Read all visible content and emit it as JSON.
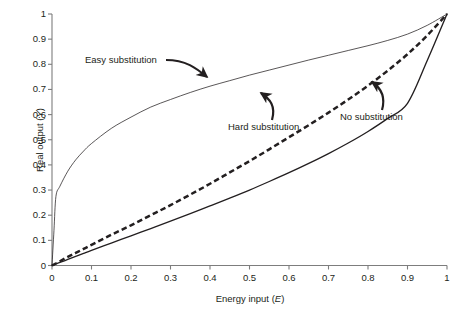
{
  "figure": {
    "background": "#ffffff",
    "ink_color": "#231f20"
  },
  "axes": {
    "x": {
      "title_text": "Energy input (",
      "title_var": "E",
      "title_close": ")",
      "ticks": [
        "0",
        "0.1",
        "0.2",
        "0.3",
        "0.4",
        "0.5",
        "0.6",
        "0.7",
        "0.8",
        "0.9",
        "1"
      ],
      "min": 0,
      "max": 1
    },
    "y": {
      "title_text": "Real output (",
      "title_var": "Y",
      "title_close": ")",
      "ticks": [
        "0",
        "0.1",
        "0.2",
        "0.3",
        "0.4",
        "0.5",
        "0.6",
        "0.7",
        "0.8",
        "0.9",
        "1"
      ],
      "min": 0,
      "max": 1
    }
  },
  "annotations": {
    "easy": "Easy substitution",
    "hard": "Hard substitution",
    "no": "No substitution"
  },
  "chart_data": {
    "type": "line",
    "title": "",
    "xlabel": "Energy input (E)",
    "ylabel": "Real output (Y)",
    "xlim": [
      0,
      1
    ],
    "ylim": [
      0,
      1
    ],
    "grid": false,
    "legend": "annotations-with-arrows",
    "xticks": [
      0,
      0.1,
      0.2,
      0.3,
      0.4,
      0.5,
      0.6,
      0.7,
      0.8,
      0.9,
      1
    ],
    "yticks": [
      0,
      0.1,
      0.2,
      0.3,
      0.4,
      0.5,
      0.6,
      0.7,
      0.8,
      0.9,
      1
    ],
    "x": [
      0,
      0.005,
      0.01,
      0.02,
      0.04,
      0.06,
      0.08,
      0.1,
      0.15,
      0.2,
      0.25,
      0.3,
      0.35,
      0.4,
      0.45,
      0.5,
      0.55,
      0.6,
      0.65,
      0.7,
      0.75,
      0.8,
      0.85,
      0.9,
      0.95,
      1
    ],
    "series": [
      {
        "name": "Easy substitution",
        "style": "thin-solid",
        "color": "#231f20",
        "linewidth": 0.7,
        "values": [
          0,
          0.14,
          0.275,
          0.315,
          0.375,
          0.42,
          0.455,
          0.485,
          0.545,
          0.59,
          0.63,
          0.66,
          0.688,
          0.713,
          0.735,
          0.757,
          0.777,
          0.797,
          0.817,
          0.836,
          0.855,
          0.874,
          0.895,
          0.92,
          0.955,
          1
        ]
      },
      {
        "name": "Hard substitution",
        "style": "thick-dashed",
        "color": "#231f20",
        "linewidth": 2.4,
        "values": [
          0,
          0.004,
          0.008,
          0.017,
          0.034,
          0.05,
          0.066,
          0.082,
          0.122,
          0.16,
          0.2,
          0.24,
          0.282,
          0.325,
          0.37,
          0.415,
          0.462,
          0.51,
          0.558,
          0.608,
          0.66,
          0.715,
          0.775,
          0.84,
          0.915,
          1
        ]
      },
      {
        "name": "No substitution",
        "style": "medium-solid",
        "color": "#231f20",
        "linewidth": 1.3,
        "values": [
          0,
          0.003,
          0.006,
          0.012,
          0.024,
          0.036,
          0.048,
          0.06,
          0.089,
          0.118,
          0.147,
          0.176,
          0.206,
          0.237,
          0.268,
          0.3,
          0.334,
          0.369,
          0.406,
          0.445,
          0.487,
          0.533,
          0.585,
          0.645,
          0.815,
          1
        ]
      }
    ]
  }
}
